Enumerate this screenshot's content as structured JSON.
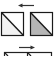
{
  "icon": {
    "name": "flip-swap-icon",
    "colors": {
      "background": "#ffffff",
      "stroke": "#1a1a1a",
      "arrow": "#333333",
      "left_fill": "#f2f2f2",
      "right_fill": "#b5b5b5",
      "bottom_stroke": "#222222"
    },
    "top_arrow": {
      "direction": "left"
    },
    "bottom_arrow": {
      "direction": "right"
    }
  }
}
